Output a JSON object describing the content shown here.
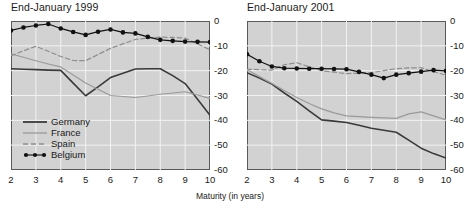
{
  "axis_caption": "Maturity (in years)",
  "legend": {
    "items": [
      {
        "label": "Germany",
        "style": "solid",
        "color": "#3a3a3a",
        "width": 1.6,
        "markers": false
      },
      {
        "label": "France",
        "style": "solid",
        "color": "#9a9a9a",
        "width": 1.2,
        "markers": false
      },
      {
        "label": "Spain",
        "style": "dashed",
        "color": "#8f8f8f",
        "width": 1.2,
        "markers": false
      },
      {
        "label": "Belgium",
        "style": "solid",
        "color": "#111111",
        "width": 1.2,
        "markers": true
      }
    ]
  },
  "chart_data": [
    {
      "type": "line",
      "title": "End-January 1999",
      "xlabel": "Maturity (in years)",
      "ylabel": "",
      "xlim": [
        2,
        10
      ],
      "ylim": [
        -60,
        0
      ],
      "xticks": [
        2,
        3,
        4,
        5,
        6,
        7,
        8,
        9,
        10
      ],
      "yticks": [
        0,
        -10,
        -20,
        -30,
        -40,
        -50,
        -60
      ],
      "ytick_labels": [
        "0",
        "-10",
        "-20",
        "-30",
        "-40",
        "-50",
        "-60"
      ],
      "grid": true,
      "legend_position": "lower-left",
      "x": [
        2,
        2.5,
        3,
        3.5,
        4,
        4.5,
        5,
        5.5,
        6,
        6.5,
        7,
        7.5,
        8,
        8.5,
        9,
        9.5,
        10
      ],
      "series": [
        {
          "name": "Germany",
          "values": [
            -19.2,
            -19.4,
            -19.6,
            -19.8,
            -19.9,
            -25.0,
            -30.1,
            -26.5,
            -22.8,
            -21.0,
            -19.3,
            -19.2,
            -19.2,
            -22.0,
            -25.2,
            -31.5,
            -38.0
          ]
        },
        {
          "name": "France",
          "values": [
            -13.2,
            -14.6,
            -16.0,
            -17.3,
            -18.5,
            -21.7,
            -25.0,
            -27.5,
            -30.0,
            -30.4,
            -30.8,
            -30.2,
            -29.5,
            -29.0,
            -28.5,
            -29.8,
            -31.2
          ]
        },
        {
          "name": "Spain",
          "values": [
            -14.0,
            -12.0,
            -10.2,
            -12.2,
            -14.3,
            -15.9,
            -16.0,
            -13.5,
            -11.0,
            -9.2,
            -7.4,
            -6.9,
            -6.5,
            -6.6,
            -6.9,
            -9.2,
            -11.6
          ]
        },
        {
          "name": "Belgium",
          "values": [
            -3.8,
            -2.6,
            -1.8,
            -1.2,
            -3.0,
            -4.4,
            -5.6,
            -4.3,
            -3.4,
            -4.6,
            -5.0,
            -6.4,
            -7.6,
            -8.0,
            -8.3,
            -8.4,
            -8.5
          ]
        }
      ],
      "belgium_tail": {
        "x": [
          8,
          8.5,
          9,
          9.5,
          10
        ],
        "values": [
          -7.6,
          -8.0,
          -8.2,
          -7.9,
          -8.4
        ]
      }
    },
    {
      "type": "line",
      "title": "End-January 2001",
      "xlabel": "Maturity (in years)",
      "ylabel": "",
      "xlim": [
        2,
        10
      ],
      "ylim": [
        -60,
        0
      ],
      "xticks": [
        2,
        3,
        4,
        5,
        6,
        7,
        8,
        9,
        10
      ],
      "yticks": [
        0,
        -10,
        -20,
        -30,
        -40,
        -50,
        -60
      ],
      "ytick_labels": [
        "0",
        "-10",
        "-20",
        "-30",
        "-40",
        "-50",
        "-60"
      ],
      "grid": true,
      "legend_position": "none",
      "x": [
        2,
        2.5,
        3,
        3.5,
        4,
        4.5,
        5,
        5.5,
        6,
        6.5,
        7,
        7.5,
        8,
        8.5,
        9,
        9.5,
        10
      ],
      "series": [
        {
          "name": "Germany",
          "values": [
            -20.8,
            -23.0,
            -25.4,
            -29.0,
            -32.4,
            -36.2,
            -39.8,
            -40.3,
            -40.9,
            -42.0,
            -43.2,
            -44.0,
            -44.8,
            -48.0,
            -51.2,
            -53.4,
            -55.2
          ]
        },
        {
          "name": "France",
          "values": [
            -19.6,
            -22.4,
            -25.2,
            -28.0,
            -30.8,
            -33.2,
            -35.4,
            -37.0,
            -38.2,
            -38.5,
            -38.8,
            -39.0,
            -39.2,
            -37.4,
            -36.6,
            -38.2,
            -39.8
          ]
        },
        {
          "name": "Spain",
          "values": [
            -19.4,
            -19.6,
            -19.8,
            -17.6,
            -16.8,
            -18.4,
            -20.0,
            -20.6,
            -21.2,
            -21.0,
            -20.8,
            -20.0,
            -19.2,
            -18.9,
            -18.8,
            -20.4,
            -21.8
          ]
        },
        {
          "name": "Belgium",
          "values": [
            -13.4,
            -16.2,
            -18.3,
            -19.0,
            -19.1,
            -19.2,
            -19.2,
            -19.3,
            -19.4,
            -20.5,
            -21.6,
            -23.0,
            -21.6,
            -21.0,
            -20.4,
            -19.8,
            -20.1
          ]
        }
      ]
    }
  ]
}
